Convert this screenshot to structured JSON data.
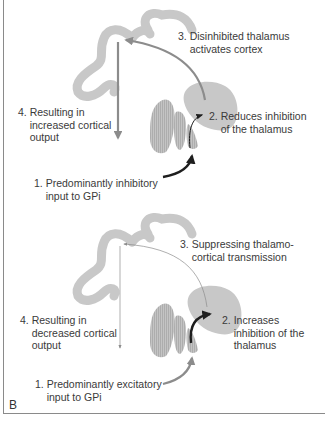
{
  "panel_label": "B",
  "top_diagram": {
    "step3": "3. Disinhibited thalamus\n    activates cortex",
    "step2": "2. Reduces inhibition\n    of the thalamus",
    "step4": "4. Resulting in\n    increased cortical\n    output",
    "step1": "1. Predominantly inhibitory\n    input to GPi"
  },
  "bottom_diagram": {
    "step3": "3. Suppressing thalamo-\n    cortical transmission",
    "step2": "2. Increases\n    inhibition of the\n    thalamus",
    "step4": "4. Resulting in\n    decreased cortical\n    output",
    "step1": "1. Predominantly excitatory\n    input to GPi"
  },
  "colors": {
    "structure_fill": "#c8c8c8",
    "arrow_gray": "#8c8c8c",
    "arrow_dark": "#1e1e1e",
    "text": "#3a3a3a"
  }
}
